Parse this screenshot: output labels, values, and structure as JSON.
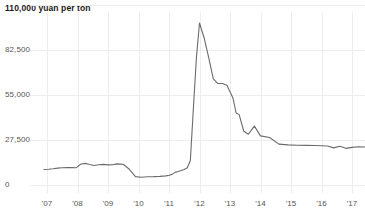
{
  "chart_data": {
    "type": "line",
    "title": "110,000 yuan per ton",
    "xlabel": "",
    "ylabel": "",
    "unit": "yuan per ton",
    "grid": true,
    "legend": "none",
    "line_color": "#6b6b6b",
    "background_color": "#ffffff",
    "axis_label_color": "#555555",
    "gridline_color": "#ededed",
    "ylim": [
      0,
      110000
    ],
    "ytick_labels": [
      "110,000 yuan per ton",
      "82,500",
      "55,000",
      "27,500",
      "0"
    ],
    "ytick_values": [
      110000,
      82500,
      55000,
      27500,
      0
    ],
    "xlim": [
      2006.9,
      2017.6
    ],
    "xtick_labels": [
      "'07",
      "'08",
      "'09",
      "'10",
      "'11",
      "'12",
      "'13",
      "'14",
      "'15",
      "'16",
      "'17"
    ],
    "xtick_values": [
      2007,
      2008,
      2009,
      2010,
      2011,
      2012,
      2013,
      2014,
      2015,
      2016,
      2017
    ],
    "x": [
      2006.9,
      2007.05,
      2007.2,
      2007.35,
      2007.5,
      2007.65,
      2007.8,
      2007.95,
      2008.1,
      2008.25,
      2008.4,
      2008.55,
      2008.7,
      2008.85,
      2009.0,
      2009.15,
      2009.3,
      2009.5,
      2009.7,
      2009.9,
      2010.1,
      2010.3,
      2010.5,
      2010.7,
      2010.9,
      2011.0,
      2011.1,
      2011.2,
      2011.3,
      2011.4,
      2011.5,
      2011.6,
      2011.7,
      2011.8,
      2011.9,
      2012.0,
      2012.15,
      2012.3,
      2012.45,
      2012.6,
      2012.75,
      2012.9,
      2013.0,
      2013.1,
      2013.2,
      2013.3,
      2013.45,
      2013.6,
      2013.8,
      2014.0,
      2014.3,
      2014.6,
      2014.9,
      2015.2,
      2015.5,
      2015.8,
      2016.0,
      2016.2,
      2016.4,
      2016.6,
      2016.8,
      2017.0,
      2017.2,
      2017.45
    ],
    "values": [
      9500,
      9600,
      9900,
      10300,
      10500,
      10600,
      10600,
      10500,
      12700,
      13200,
      12500,
      11900,
      12400,
      12600,
      12300,
      12400,
      12900,
      12700,
      9600,
      5100,
      4700,
      5000,
      5100,
      5300,
      5600,
      6000,
      6500,
      7700,
      8200,
      8800,
      9500,
      10500,
      15000,
      47000,
      78000,
      99000,
      90000,
      78000,
      65000,
      62000,
      62000,
      61000,
      57000,
      53000,
      44000,
      43000,
      33000,
      31000,
      36000,
      30000,
      29000,
      25000,
      24500,
      24300,
      24200,
      24100,
      24000,
      23800,
      22700,
      23700,
      22400,
      23000,
      23400,
      23200
    ]
  }
}
